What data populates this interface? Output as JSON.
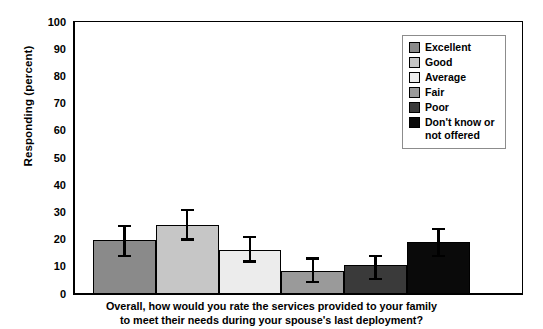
{
  "chart_data": {
    "type": "bar",
    "title": "",
    "caption_line1": "Overall, how would you rate the services provided to your family",
    "caption_line2": "to meet their needs during your spouse's last deployment?",
    "xlabel": "",
    "ylabel": "Responding (percent)",
    "ylim": [
      0,
      100
    ],
    "ytick_step": 10,
    "yticks": [
      0,
      10,
      20,
      30,
      40,
      50,
      60,
      70,
      80,
      90,
      100
    ],
    "grid": false,
    "legend_position": "top-right",
    "categories": [
      "Excellent",
      "Good",
      "Average",
      "Fair",
      "Poor",
      "Don't know or\nnot offered"
    ],
    "values": [
      20,
      25.5,
      16,
      8.5,
      10.5,
      19
    ],
    "error_low": [
      14,
      20,
      12,
      4.5,
      5.5,
      14
    ],
    "error_high": [
      25,
      31,
      21,
      13,
      14,
      24
    ],
    "colors": [
      "#8a8a8a",
      "#c6c6c6",
      "#ececec",
      "#9a9a9a",
      "#3a3a3a",
      "#0a0a0a"
    ]
  },
  "legend": {
    "items": [
      {
        "label": "Excellent",
        "color": "#8a8a8a"
      },
      {
        "label": "Good",
        "color": "#c6c6c6"
      },
      {
        "label": "Average",
        "color": "#ececec"
      },
      {
        "label": "Fair",
        "color": "#9a9a9a"
      },
      {
        "label": "Poor",
        "color": "#3a3a3a"
      },
      {
        "label": "Don't know or\nnot offered",
        "color": "#0a0a0a"
      }
    ]
  }
}
